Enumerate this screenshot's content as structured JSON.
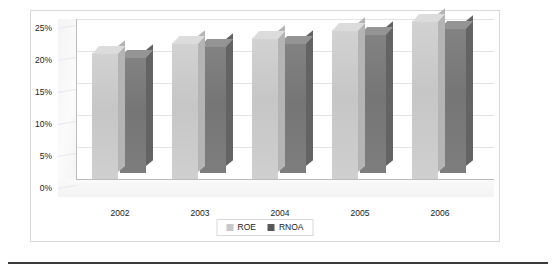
{
  "chart_data": {
    "type": "bar",
    "title": "",
    "subtitle": "",
    "xlabel": "",
    "ylabel": "",
    "categories": [
      "2002",
      "2003",
      "2004",
      "2005",
      "2006"
    ],
    "series": [
      {
        "name": "ROE",
        "color": "#c8c8c8",
        "values": [
          19.7,
          21.2,
          22.0,
          23.3,
          24.7
        ]
      },
      {
        "name": "RNOA",
        "color": "#787878",
        "values": [
          18.2,
          19.8,
          20.3,
          21.7,
          22.7
        ]
      }
    ],
    "ylim": [
      0,
      25
    ],
    "ytick_values": [
      0,
      5,
      10,
      15,
      20,
      25
    ],
    "ytick_labels": [
      "0%",
      "5%",
      "10%",
      "15%",
      "20%",
      "25%"
    ],
    "grid": true,
    "legend_position": "bottom",
    "three_d": true
  },
  "axes": {
    "y_ticks": [
      {
        "label": "25%",
        "value": 25
      },
      {
        "label": "20%",
        "value": 20
      },
      {
        "label": "15%",
        "value": 15
      },
      {
        "label": "10%",
        "value": 10
      },
      {
        "label": "5%",
        "value": 5
      },
      {
        "label": "0%",
        "value": 0
      }
    ],
    "x_ticks": [
      {
        "label": "2002"
      },
      {
        "label": "2003"
      },
      {
        "label": "2004"
      },
      {
        "label": "2005"
      },
      {
        "label": "2006"
      }
    ]
  },
  "legend": {
    "items": [
      {
        "label": "ROE",
        "color": "#c8c8c8"
      },
      {
        "label": "RNOA",
        "color": "#585858"
      }
    ]
  }
}
